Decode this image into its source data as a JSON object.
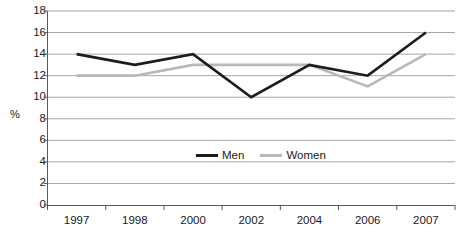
{
  "chart_data": {
    "type": "line",
    "title": "",
    "xlabel": "",
    "ylabel": "%",
    "categories": [
      "1997",
      "1998",
      "2000",
      "2002",
      "2004",
      "2006",
      "2007"
    ],
    "series": [
      {
        "name": "Men",
        "color": "#1c1c1c",
        "values": [
          14,
          13,
          14,
          10,
          13,
          12,
          16
        ]
      },
      {
        "name": "Women",
        "color": "#b8b8b8",
        "values": [
          12,
          12,
          13,
          13,
          13,
          11,
          14
        ]
      }
    ],
    "ylim": [
      0,
      18
    ],
    "ytick_step": 2,
    "yticks": [
      "18",
      "16",
      "14",
      "12",
      "10",
      "8",
      "6",
      "4",
      "2",
      "0"
    ],
    "grid": true,
    "grid_color": "#808080",
    "axis_color": "#595959",
    "legend_position": "inside-center"
  },
  "legend": {
    "men_label": "Men",
    "women_label": "Women"
  },
  "axes": {
    "y_axis_title": "%"
  }
}
